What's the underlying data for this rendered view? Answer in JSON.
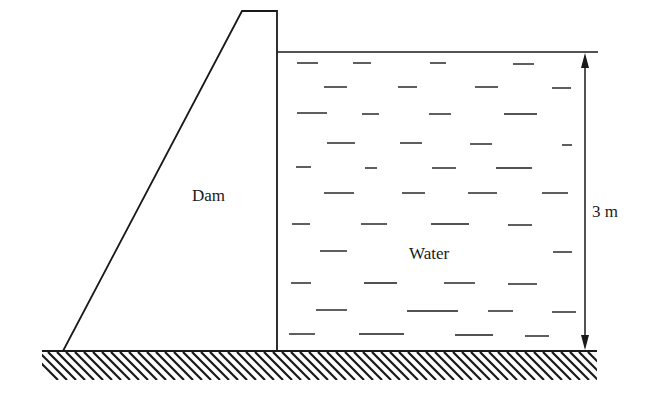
{
  "diagram": {
    "labels": {
      "dam": "Dam",
      "water": "Water",
      "height": "3 m"
    },
    "colors": {
      "stroke": "#1a1a1a",
      "background": "#ffffff"
    },
    "dimension": {
      "value": 3,
      "unit": "m",
      "arrow": "double-headed vertical"
    }
  }
}
